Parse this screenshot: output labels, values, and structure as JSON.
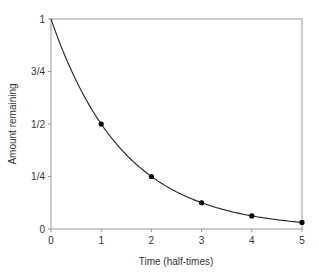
{
  "chart_data": {
    "type": "line",
    "title": "",
    "xlabel": "Time (half-times)",
    "ylabel": "Amount remaining",
    "xlim": [
      0,
      5
    ],
    "ylim": [
      0,
      1
    ],
    "x_ticks": [
      "0",
      "1",
      "2",
      "3",
      "4",
      "5"
    ],
    "y_ticks": [
      "0",
      "1/4",
      "1/2",
      "3/4",
      "1"
    ],
    "grid": false,
    "legend": null,
    "series": [
      {
        "name": "Exponential decay curve",
        "style": "line",
        "function": "y = 0.5^x",
        "x": [
          0,
          0.25,
          0.5,
          1,
          1.5,
          2,
          2.5,
          3,
          3.5,
          4,
          4.5,
          5
        ],
        "values": [
          1,
          0.841,
          0.707,
          0.5,
          0.354,
          0.25,
          0.177,
          0.125,
          0.088,
          0.0625,
          0.044,
          0.03125
        ]
      },
      {
        "name": "Half-time markers",
        "style": "markers",
        "x": [
          1,
          2,
          3,
          4,
          5
        ],
        "values": [
          0.5,
          0.25,
          0.125,
          0.0625,
          0.03125
        ]
      }
    ]
  },
  "axes": {
    "xlabel": "Time (half-times)",
    "ylabel": "Amount remaining"
  },
  "colors": {
    "axis": "#999999",
    "curve": "#222222",
    "marker": "#000000",
    "text": "#333333"
  }
}
